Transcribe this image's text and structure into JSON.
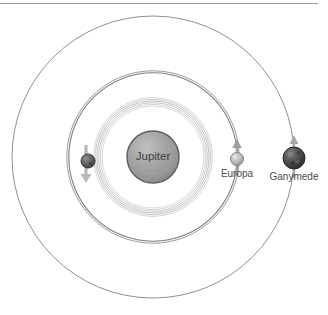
{
  "scene": {
    "title": "Jupiter moon orbits diagram",
    "background_color": "#ffffff",
    "top_rule_color": "#9a9a9a"
  },
  "primary": {
    "name": "Jupiter",
    "label": "Jupiter",
    "cx": 153,
    "cy": 157,
    "radius": 26,
    "fill": "#9a9a9a",
    "stroke": "#5d5d5d"
  },
  "orbits": [
    {
      "name": "io-orbit",
      "radius": 56,
      "style": "banded",
      "band_count": 6,
      "stroke": "#c9c9c9",
      "stroke_width": 1
    },
    {
      "name": "europa-orbit",
      "radius": 85,
      "style": "double",
      "band_count": 2,
      "stroke": "#8a8a8a",
      "stroke_width": 1.1
    },
    {
      "name": "ganymede-orbit",
      "radius": 141,
      "style": "single",
      "band_count": 1,
      "stroke": "#8f8f8f",
      "stroke_width": 1
    }
  ],
  "moons": [
    {
      "name": "io",
      "label": "Io",
      "label_visible": false,
      "cx": 88,
      "cy": 161,
      "radius": 7,
      "fill": "#6b6b6b",
      "stroke": "#3c3c3c",
      "arrow": "down",
      "arrow_color": "#b8b8b8"
    },
    {
      "name": "europa",
      "label": "Europa",
      "label_visible": true,
      "cx": 237,
      "cy": 159,
      "radius": 6.5,
      "fill": "#bdbdbd",
      "stroke": "#7a7a7a",
      "arrow": "up",
      "arrow_color": "#9e9e9e"
    },
    {
      "name": "ganymede",
      "label": "Ganymede",
      "label_visible": true,
      "cx": 294,
      "cy": 158,
      "radius": 11,
      "fill": "#4d4d4d",
      "stroke": "#2b2b2b",
      "arrow": "up",
      "arrow_color": "#a8a8a8"
    }
  ]
}
